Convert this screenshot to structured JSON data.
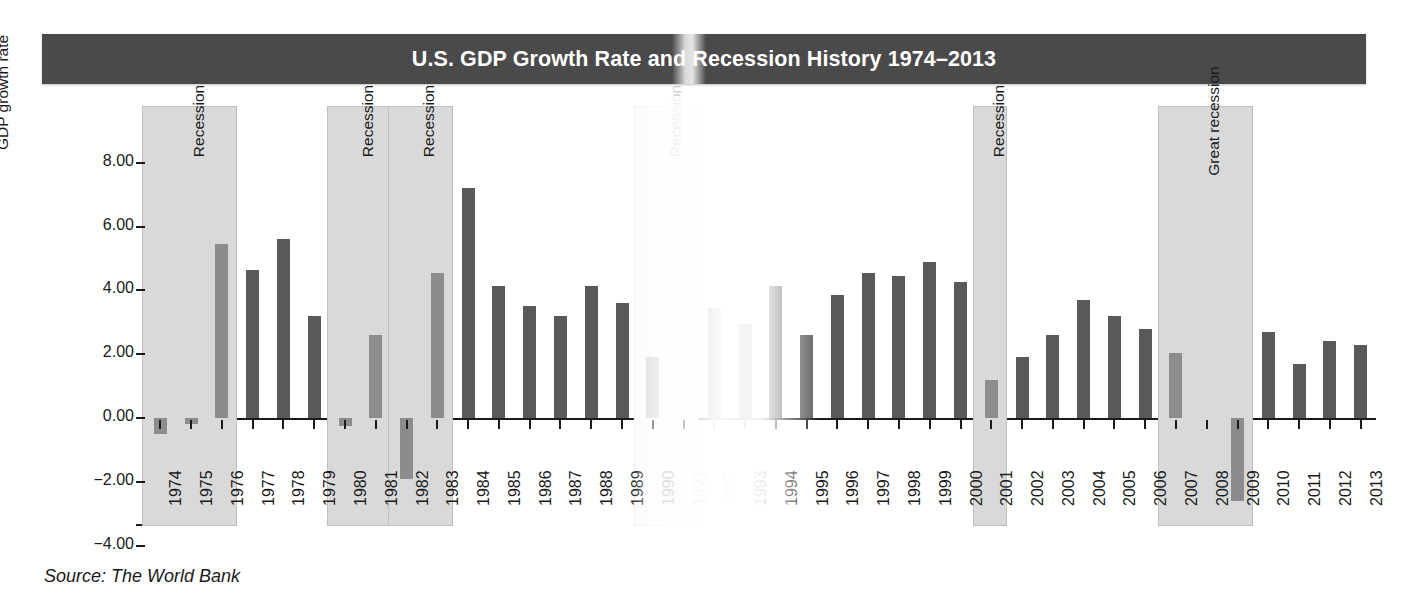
{
  "title": "U.S. GDP Growth Rate and Recession History 1974–2013",
  "source_note": "Source: The World Bank",
  "axis": {
    "ylabel": "GDP growth rate",
    "yticks": [
      "8.00",
      "6.00",
      "4.00",
      "2.00",
      "0.00",
      "−2.00",
      "−4.00"
    ]
  },
  "colors": {
    "banner": "#4a4a4a",
    "bar": "#595959",
    "bar_in_recession": "#8c8c8c",
    "recession_band": "#d9d9d9",
    "background": "#ffffff"
  },
  "chart_data": {
    "type": "bar",
    "title": "U.S. GDP Growth Rate and Recession History 1974–2013",
    "xlabel": "",
    "ylabel": "GDP growth rate",
    "ylim": [
      -4.0,
      8.95
    ],
    "grid": false,
    "legend": null,
    "categories": [
      "1974",
      "1975",
      "1976",
      "1977",
      "1978",
      "1979",
      "1980",
      "1981",
      "1982",
      "1983",
      "1984",
      "1985",
      "1986",
      "1987",
      "1988",
      "1989",
      "1990",
      "1991",
      "1992",
      "1993",
      "1994",
      "1995",
      "1996",
      "1997",
      "1998",
      "1999",
      "2000",
      "2001",
      "2002",
      "2003",
      "2004",
      "2005",
      "2006",
      "2007",
      "2008",
      "2009",
      "2010",
      "2011",
      "2012",
      "2013"
    ],
    "values": [
      -0.5,
      -0.2,
      5.45,
      4.65,
      5.6,
      3.2,
      -0.25,
      2.6,
      -1.9,
      4.55,
      7.2,
      4.15,
      3.5,
      3.2,
      4.15,
      3.6,
      1.9,
      0.0,
      3.45,
      2.95,
      4.15,
      2.6,
      3.85,
      4.55,
      4.45,
      4.9,
      4.25,
      1.2,
      1.9,
      2.6,
      3.7,
      3.2,
      2.8,
      2.05,
      0.0,
      -2.6,
      2.7,
      1.7,
      2.4,
      2.3
    ],
    "bands": [
      {
        "label": "Recession",
        "start": "1974",
        "end": "1976",
        "faded": false
      },
      {
        "label": "Recession",
        "start": "1980",
        "end": "1981",
        "faded": false
      },
      {
        "label": "Recession",
        "start": "1982",
        "end": "1983",
        "faded": false
      },
      {
        "label": "Recession",
        "start": "1990",
        "end": "1991",
        "faded": true
      },
      {
        "label": "Recession",
        "start": "2001",
        "end": "2001",
        "faded": false
      },
      {
        "label": "Great recession",
        "start": "2007",
        "end": "2009",
        "faded": false
      }
    ]
  }
}
